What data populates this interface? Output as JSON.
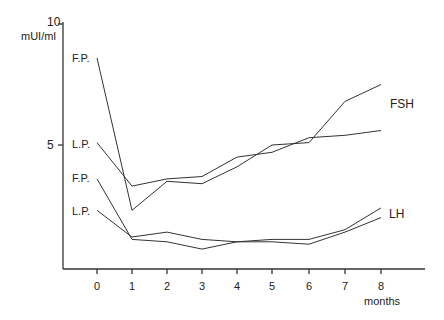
{
  "chart_data": {
    "type": "line",
    "title": "",
    "xlabel": "months",
    "ylabel": "mUI/ml",
    "x": [
      0,
      1,
      2,
      3,
      4,
      5,
      6,
      7,
      8
    ],
    "x_tick_labels": [
      "0",
      "1",
      "2",
      "3",
      "4",
      "5",
      "6",
      "7",
      "8"
    ],
    "y_tick_labels": [
      "5",
      "10"
    ],
    "ylim": [
      0,
      10
    ],
    "grid": false,
    "legend_position": "inline at line ends",
    "series": [
      {
        "name": "FSH F.P.",
        "group": "FSH",
        "start_label": "F.P.",
        "values": [
          8.6,
          2.3,
          3.5,
          3.4,
          4.1,
          5.0,
          5.1,
          6.8,
          7.5
        ]
      },
      {
        "name": "FSH L.P.",
        "group": "FSH",
        "start_label": "L.P.",
        "values": [
          5.1,
          3.3,
          3.6,
          3.7,
          4.5,
          4.7,
          5.3,
          5.4,
          5.6
        ]
      },
      {
        "name": "LH F.P.",
        "group": "LH",
        "start_label": "F.P.",
        "values": [
          3.6,
          1.1,
          1.0,
          0.7,
          1.0,
          1.1,
          1.1,
          1.5,
          2.4
        ]
      },
      {
        "name": "LH L.P.",
        "group": "LH",
        "start_label": "L.P.",
        "values": [
          2.3,
          1.2,
          1.4,
          1.1,
          1.0,
          1.0,
          0.9,
          1.4,
          2.0
        ]
      }
    ],
    "annotations": [
      "FSH",
      "LH",
      "F.P.",
      "L.P.",
      "F.P.",
      "L.P."
    ]
  },
  "labels": {
    "y_unit": "mUI/ml",
    "y_top": "10",
    "y_mid": "5",
    "x_unit": "months",
    "fsh": "FSH",
    "lh": "LH",
    "fsh_fp": "F.P.",
    "fsh_lp": "L.P.",
    "lh_fp": "F.P.",
    "lh_lp": "L.P."
  }
}
